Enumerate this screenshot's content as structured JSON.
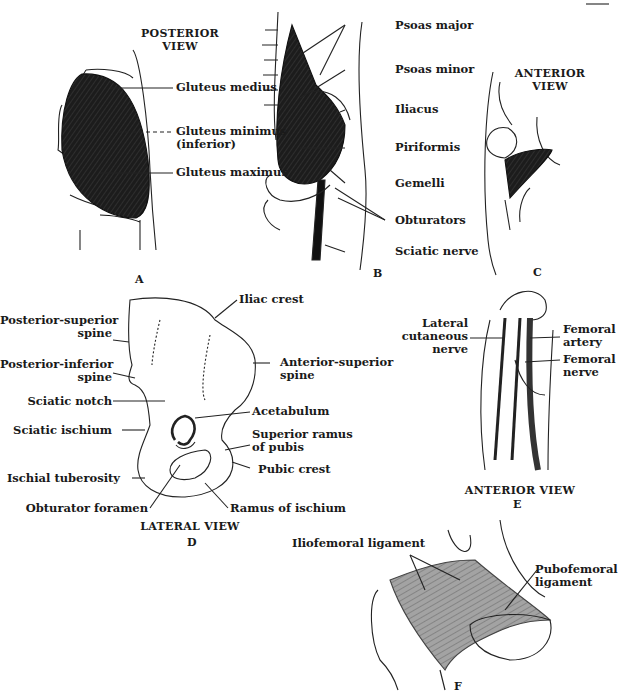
{
  "figure": {
    "panels": {
      "A": {
        "letter": "A",
        "title_line1": "POSTERIOR",
        "title_line2": "VIEW",
        "labels": [
          "Gluteus medius",
          "Gluteus minimus",
          "(inferior)",
          "Gluteus maximus"
        ]
      },
      "B": {
        "letter": "B",
        "labels": [
          "Psoas major",
          "Psoas minor",
          "Iliacus",
          "Piriformis",
          "Gemelli",
          "Obturators",
          "Sciatic nerve"
        ]
      },
      "C": {
        "letter": "C",
        "title_line1": "ANTERIOR",
        "title_line2": "VIEW"
      },
      "D": {
        "letter": "D",
        "caption": "LATERAL VIEW",
        "labels": {
          "iliac_crest": "Iliac crest",
          "posterior_superior_1": "Posterior-superior",
          "posterior_superior_2": "spine",
          "anterior_superior_1": "Anterior-superior",
          "anterior_superior_2": "spine",
          "posterior_inferior_1": "Posterior-inferior",
          "posterior_inferior_2": "spine",
          "sciatic_notch": "Sciatic notch",
          "acetabulum": "Acetabulum",
          "sciatic_ischium": "Sciatic ischium",
          "superior_ramus_1": "Superior ramus",
          "superior_ramus_2": "of pubis",
          "pubic_crest": "Pubic crest",
          "ischial_tuberosity": "Ischial tuberosity",
          "obturator_foramen": "Obturator foramen",
          "ramus_of_ischium": "Ramus of ischium"
        }
      },
      "E": {
        "letter": "E",
        "caption": "ANTERIOR VIEW",
        "labels": {
          "lateral_cutaneous_1": "Lateral",
          "lateral_cutaneous_2": "cutaneous",
          "lateral_cutaneous_3": "nerve",
          "femoral_artery_1": "Femoral",
          "femoral_artery_2": "artery",
          "femoral_nerve_1": "Femoral",
          "femoral_nerve_2": "nerve"
        }
      },
      "F": {
        "letter": "F",
        "labels": {
          "iliofemoral": "Iliofemoral ligament",
          "pubofemoral_1": "Pubofemoral",
          "pubofemoral_2": "ligament"
        }
      }
    },
    "colors": {
      "muscle": "#1c1c1c",
      "ligament": "#9a9a9a",
      "line": "#222222",
      "background": "#ffffff"
    }
  }
}
